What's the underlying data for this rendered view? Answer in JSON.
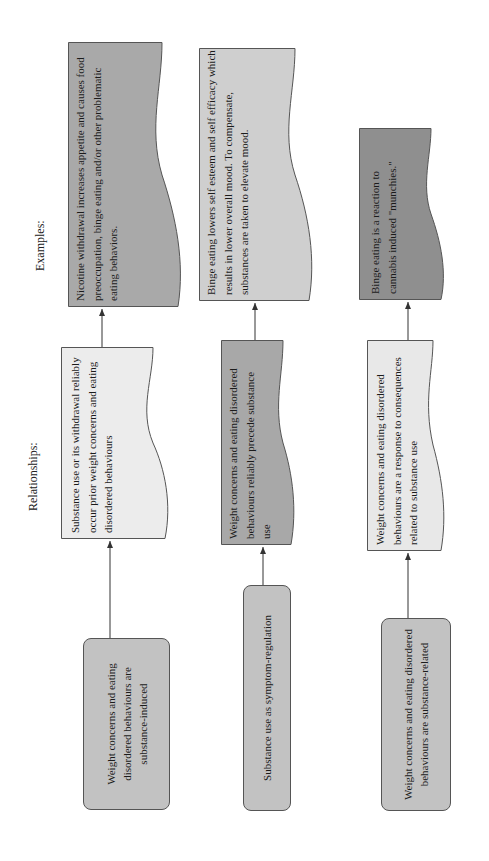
{
  "headings": {
    "relationships": "Relationships:",
    "examples": "Examples:"
  },
  "rows": [
    {
      "category": "Weight concerns and eating disordered behaviours are substance-induced",
      "relationship": "Substance use or its withdrawal reliably occur prior weight concerns and eating disordered behaviours",
      "example": "Nicotine withdrawal increases appetite and causes food preoccupation, binge eating and/or other problematic eating behaviors."
    },
    {
      "category": "Substance use as symptom-regulation",
      "relationship": "Weight concerns and eating disordered behaviours reliably precede substance use",
      "example": "Binge eating lowers self esteem and self efficacy which results in lower overall mood. To compensate, substances are taken to elevate mood."
    },
    {
      "category": "Weight concerns and eating disordered behaviours are substance-related",
      "relationship": "Weight concerns and eating disordered behaviours are a response to consequences related to substance use",
      "example": "Binge eating is a reaction to cannabis induced \"munchies.\""
    }
  ],
  "colors": {
    "category_fill": "#c2c2c2",
    "relationship_fills": [
      "#ececec",
      "#a8a8a8",
      "#e8e8e8"
    ],
    "example_fills": [
      "#a9a9a9",
      "#cfcfcf",
      "#8f8f8f"
    ],
    "stroke": "#555555",
    "connector": "#333333"
  }
}
